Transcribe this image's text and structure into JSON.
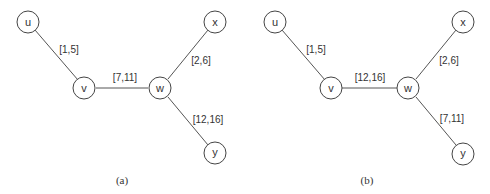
{
  "panels": [
    {
      "caption": "(a)",
      "nodes": {
        "u": "u",
        "v": "v",
        "w": "w",
        "x": "x",
        "y": "y"
      },
      "edges": {
        "uv": "[1,5]",
        "vw": "[7,11]",
        "wx": "[2,6]",
        "wy": "[12,16]"
      }
    },
    {
      "caption": "(b)",
      "nodes": {
        "u": "u",
        "v": "v",
        "w": "w",
        "x": "x",
        "y": "y"
      },
      "edges": {
        "uv": "[1,5]",
        "vw": "[12,16]",
        "wx": "[2,6]",
        "wy": "[7,11]"
      }
    }
  ]
}
